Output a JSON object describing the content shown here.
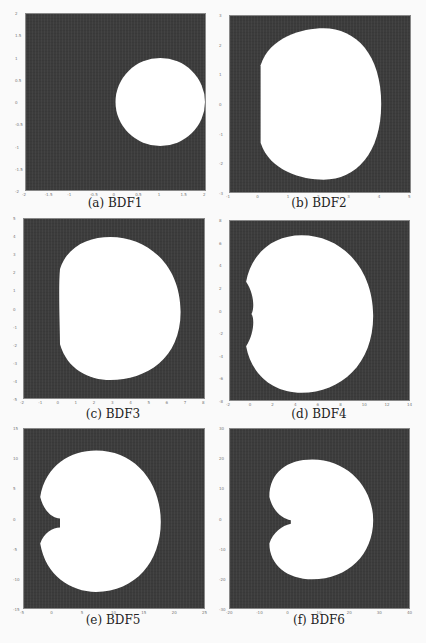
{
  "figure": {
    "panels": [
      {
        "id": "a",
        "caption": "(a) BDF1"
      },
      {
        "id": "b",
        "caption": "(b) BDF2"
      },
      {
        "id": "c",
        "caption": "(c) BDF3"
      },
      {
        "id": "d",
        "caption": "(d) BDF4"
      },
      {
        "id": "e",
        "caption": "(e) BDF5"
      },
      {
        "id": "f",
        "caption": "(f) BDF6"
      }
    ]
  },
  "colors": {
    "unstable_region": "#3c3c3c",
    "stable_region": "#ffffff"
  },
  "chart_data": [
    {
      "type": "heatmap",
      "title": "(a) BDF1",
      "description": "Stability region: exterior of white disk centered at 1 radius 1",
      "xlim": [
        -2,
        2
      ],
      "ylim": [
        -2,
        2
      ],
      "xticks": [
        "-2",
        "-1.5",
        "-1",
        "-0.5",
        "0",
        "0.5",
        "1",
        "1.5",
        "2"
      ],
      "yticks": [
        "2",
        "1.5",
        "1",
        "0.5",
        "0",
        "-0.5",
        "-1",
        "-1.5",
        "-2"
      ]
    },
    {
      "type": "heatmap",
      "title": "(b) BDF2",
      "xlim": [
        -1,
        5
      ],
      "ylim": [
        -3,
        3
      ],
      "xticks": [
        "-1",
        "0",
        "1",
        "2",
        "3",
        "4",
        "5"
      ],
      "yticks": [
        "3",
        "2",
        "1",
        "0",
        "-1",
        "-2",
        "-3"
      ]
    },
    {
      "type": "heatmap",
      "title": "(c) BDF3",
      "xlim": [
        -2,
        8
      ],
      "ylim": [
        -5,
        5
      ],
      "xticks": [
        "-2",
        "-1",
        "0",
        "1",
        "2",
        "3",
        "4",
        "5",
        "6",
        "7",
        "8"
      ],
      "yticks": [
        "5",
        "4",
        "3",
        "2",
        "1",
        "0",
        "-1",
        "-2",
        "-3",
        "-4",
        "-5"
      ]
    },
    {
      "type": "heatmap",
      "title": "(d) BDF4",
      "xlim": [
        -2,
        14
      ],
      "ylim": [
        -8,
        8
      ],
      "xticks": [
        "-2",
        "0",
        "2",
        "4",
        "6",
        "8",
        "10",
        "12",
        "14"
      ],
      "yticks": [
        "8",
        "6",
        "4",
        "2",
        "0",
        "-2",
        "-4",
        "-6",
        "-8"
      ]
    },
    {
      "type": "heatmap",
      "title": "(e) BDF5",
      "xlim": [
        -5,
        25
      ],
      "ylim": [
        -15,
        15
      ],
      "xticks": [
        "-5",
        "0",
        "5",
        "10",
        "15",
        "20",
        "25"
      ],
      "yticks": [
        "15",
        "10",
        "5",
        "0",
        "-5",
        "-10",
        "-15"
      ]
    },
    {
      "type": "heatmap",
      "title": "(f) BDF6",
      "xlim": [
        -20,
        40
      ],
      "ylim": [
        -30,
        30
      ],
      "xticks": [
        "-20",
        "-10",
        "0",
        "10",
        "20",
        "30",
        "40"
      ],
      "yticks": [
        "30",
        "20",
        "10",
        "0",
        "-10",
        "-20",
        "-30"
      ]
    }
  ]
}
